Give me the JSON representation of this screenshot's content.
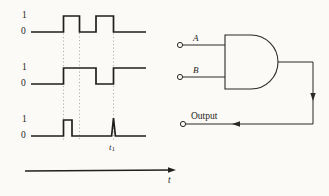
{
  "figure": {
    "background_color": "#fbfaf7",
    "ink_color": "#1d1b19",
    "timing_panel": {
      "axis_label": "t",
      "marker_label": "t",
      "marker_sublabel": "1",
      "waveforms": [
        {
          "name": "input-a",
          "high_label": "1",
          "low_label": "0",
          "transitions_pct": [
            0,
            0,
            22,
            1,
            42,
            0,
            62,
            1,
            82,
            0,
            100,
            0
          ],
          "description": "two positive pulses"
        },
        {
          "name": "input-b",
          "high_label": "1",
          "low_label": "0",
          "transitions_pct": [
            0,
            0,
            42,
            1,
            62,
            0,
            82,
            1,
            100,
            1
          ],
          "description": "delayed inverted-like pulses"
        },
        {
          "name": "output-glitch",
          "high_label": "1",
          "low_label": "0",
          "transitions_pct": [
            0,
            0,
            22,
            1,
            32,
            0,
            82,
            0,
            100,
            0
          ],
          "description": "one wide pulse plus narrow spike at t1"
        }
      ]
    },
    "gate_panel": {
      "gate_type": "AND",
      "inputs": [
        {
          "name": "input-a-terminal",
          "label": "A"
        },
        {
          "name": "input-b-terminal",
          "label": "B"
        }
      ],
      "output": {
        "name": "output-terminal",
        "label": "Output"
      }
    }
  }
}
